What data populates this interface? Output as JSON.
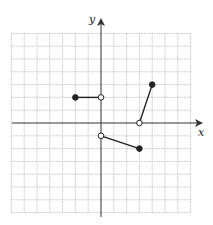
{
  "chart_data": {
    "type": "line",
    "title": "",
    "xlabel": "x",
    "ylabel": "y",
    "xlim": [
      -7,
      7
    ],
    "ylim": [
      -7,
      7
    ],
    "grid": true,
    "segments": [
      {
        "from": {
          "x": -2,
          "y": 2,
          "closed": true
        },
        "to": {
          "x": 0,
          "y": 2,
          "closed": false
        }
      },
      {
        "from": {
          "x": 0,
          "y": -1,
          "closed": false
        },
        "to": {
          "x": 3,
          "y": -2,
          "closed": true
        }
      },
      {
        "from": {
          "x": 3,
          "y": 0,
          "closed": false
        },
        "to": {
          "x": 4,
          "y": 3,
          "closed": true
        }
      }
    ]
  },
  "axes": {
    "x_label": "x",
    "y_label": "y"
  }
}
